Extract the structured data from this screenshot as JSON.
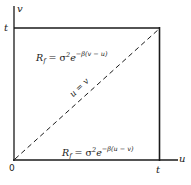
{
  "diagram": {
    "axes": {
      "x_label": "u",
      "y_label": "v",
      "origin_label": "0",
      "x_tick_label": "t",
      "y_tick_label": "t"
    },
    "regions": {
      "upper": {
        "R": "R",
        "R_sub": "f",
        "eq": " = σ",
        "pow": "2",
        "e": "e",
        "exp": "−β(v − u)"
      },
      "lower": {
        "R": "R",
        "R_sub": "f",
        "eq": " = σ",
        "pow": "2",
        "e": "e",
        "exp": "−β(u − v)"
      }
    },
    "diagonal_label": "u = v",
    "colors": {
      "line": "#1a1a1a",
      "background": "#ffffff"
    }
  }
}
